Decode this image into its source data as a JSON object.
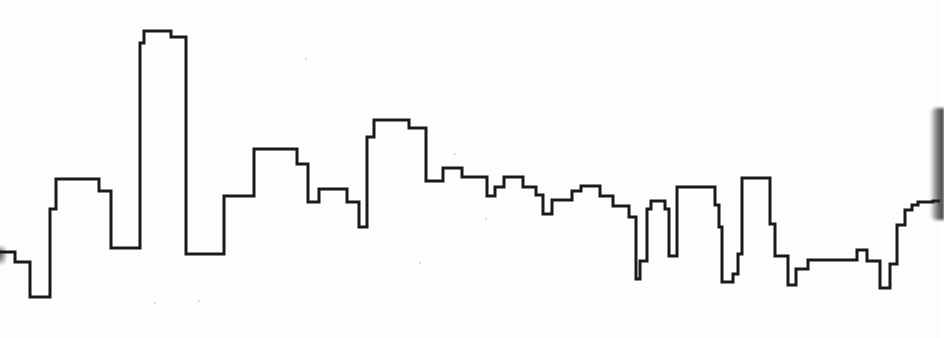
{
  "drawing": {
    "subject": "city skyline outline",
    "stroke_color": "#1a1a1a",
    "background_color": "#ffffff",
    "stroke_width": 3,
    "points": "0,252 15,252 15,262 30,262 30,297 50,297 50,209 56,209 56,179 99,179 99,191 111,191 111,248 140,248 140,43 144,43 144,31 171,31 171,37 186,37 186,254 224,254 224,196 254,196 254,149 297,149 297,164 308,164 308,202 319,202 319,189 347,189 347,202 359,202 359,227 367,227 367,137 374,137 374,120 409,120 409,128 426,128 426,181 443,181 443,168 462,168 462,177 487,177 487,196 495,196 495,187 504,187 504,177 523,177 523,187 536,187 536,195 543,195 543,214 552,214 552,200 572,200 572,191 581,191 581,186 600,186 600,196 613,196 613,206 629,206 629,217 636,217 636,279 640,279 640,261 647,261 647,209 651,209 651,201 665,201 665,209 669,209 669,256 677,256 677,187 715,187 715,205 719,205 719,227 722,227 722,282 733,282 733,274 738,274 738,254 742,254 742,178 770,178 770,224 775,224 775,256 788,256 788,285 796,285 796,269 808,269 808,260 857,260 857,250 867,250 867,261 880,261 880,288 890,288 890,264 897,264 897,225 905,225 905,210 912,210 912,205 918,205 918,202 933,202 933,201 940,201"
  }
}
